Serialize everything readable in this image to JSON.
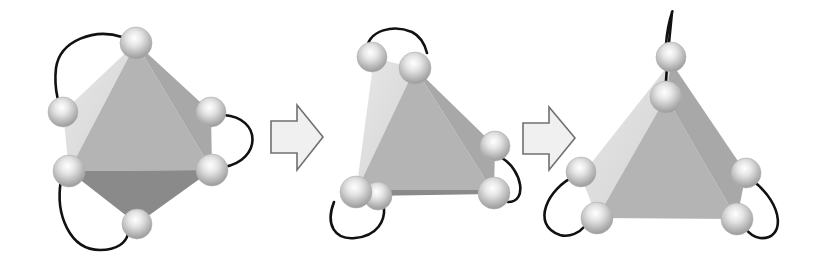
{
  "diagram": {
    "colors": {
      "background": "#ffffff",
      "face_front": "#b4b4b4",
      "face_light": "#dedede",
      "face_side": "#a8a8a8",
      "face_dark": "#8a8a8a",
      "sphere_light": "#f6f6f6",
      "sphere_dark": "#9a9a9a",
      "loop": "#111111",
      "arrow_fill": "#f0f0f0",
      "arrow_stroke": "#707070"
    },
    "stages": [
      {
        "name": "octahedron",
        "faces": [
          {
            "role": "light",
            "points": "136,43 63,112 69,171"
          },
          {
            "role": "front",
            "points": "136,43 69,171 212,170"
          },
          {
            "role": "side",
            "points": "136,43 211,112 212,170"
          },
          {
            "role": "dark",
            "points": "69,171 212,170 137,224"
          }
        ],
        "spheres": [
          {
            "x": 136,
            "y": 43,
            "r": 16
          },
          {
            "x": 63,
            "y": 112,
            "r": 15
          },
          {
            "x": 211,
            "y": 112,
            "r": 15
          },
          {
            "x": 69,
            "y": 171,
            "r": 16
          },
          {
            "x": 212,
            "y": 170,
            "r": 16
          },
          {
            "x": 137,
            "y": 224,
            "r": 15
          }
        ],
        "loops": [
          "M 122,37 C 95,28 60,40 56,68 C 54,85 57,95 58,100",
          "M 224,115 C 262,118 262,160 224,167",
          "M 61,180 C 55,215 70,250 100,250 C 118,250 126,242 128,234"
        ]
      },
      {
        "name": "distorted",
        "faces": [
          {
            "role": "light",
            "points": "374,58 415,68 356,192"
          },
          {
            "role": "front",
            "points": "415,68 356,192 494,193"
          },
          {
            "role": "side",
            "points": "415,68 495,146 494,193"
          },
          {
            "role": "dark",
            "points": "366,190 494,190 494,194 366,196"
          }
        ],
        "spheres": [
          {
            "x": 372,
            "y": 57,
            "r": 15
          },
          {
            "x": 378,
            "y": 196,
            "r": 14
          },
          {
            "x": 415,
            "y": 68,
            "r": 16
          },
          {
            "x": 495,
            "y": 146,
            "r": 15
          },
          {
            "x": 356,
            "y": 192,
            "r": 16
          },
          {
            "x": 494,
            "y": 193,
            "r": 16
          }
        ],
        "loops": [
          "M 366,52 C 368,28 395,25 412,32 C 420,36 425,45 427,53",
          "M 502,158 C 522,170 528,202 508,202",
          "M 334,202 C 325,225 335,240 355,238 C 378,236 385,220 384,208"
        ]
      },
      {
        "name": "tetrahedron",
        "faces": [
          {
            "role": "light",
            "points": "671,62 581,176 597,218 666,97"
          },
          {
            "role": "front",
            "points": "666,97 597,218 737,219"
          },
          {
            "role": "side",
            "points": "671,62 746,173 737,219 666,97"
          }
        ],
        "spheres": [
          {
            "x": 671,
            "y": 57,
            "r": 15
          },
          {
            "x": 581,
            "y": 172,
            "r": 15
          },
          {
            "x": 746,
            "y": 173,
            "r": 15
          },
          {
            "x": 666,
            "y": 97,
            "r": 16
          },
          {
            "x": 597,
            "y": 218,
            "r": 16
          },
          {
            "x": 737,
            "y": 219,
            "r": 16
          }
        ],
        "loops": [
          "M 665,95 C 667,60 670,30 672,12 C 674,8 668,20 666,44",
          "M 575,176 C 548,188 530,225 560,235 C 570,238 580,232 585,226",
          "M 752,180 C 785,205 785,240 760,238 C 752,237 748,232 745,228"
        ]
      }
    ],
    "arrows": [
      {
        "name": "arrow-1",
        "points": "271,121 297,121 297,105 323,137 297,170 297,153 271,153"
      },
      {
        "name": "arrow-2",
        "points": "523,123 549,123 549,107 575,138 549,170 549,154 523,154"
      }
    ]
  }
}
